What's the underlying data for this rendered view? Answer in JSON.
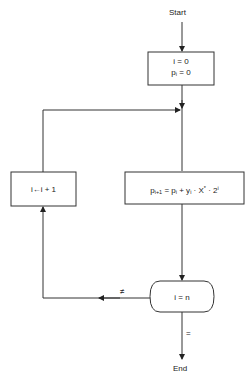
{
  "diagram": {
    "type": "flowchart",
    "start_label": "Start",
    "end_label": "End",
    "nodes": {
      "init": {
        "line1": "i = 0",
        "line2_base": "p",
        "line2_sub": "i",
        "line2_rest": " = 0"
      },
      "compute": {
        "p1": "p",
        "p1_sub": "i+1",
        "eq": " = p",
        "p2_sub": "i",
        "plus": " + y",
        "y_sub": "i",
        "x": " · X",
        "x_sup": "*",
        "two": " · 2",
        "two_sup": "i"
      },
      "increment": {
        "label": "i←i + 1"
      },
      "decision": {
        "label": "i = n"
      }
    },
    "edges": {
      "not_equal_label": "≠",
      "equal_label": "="
    }
  }
}
